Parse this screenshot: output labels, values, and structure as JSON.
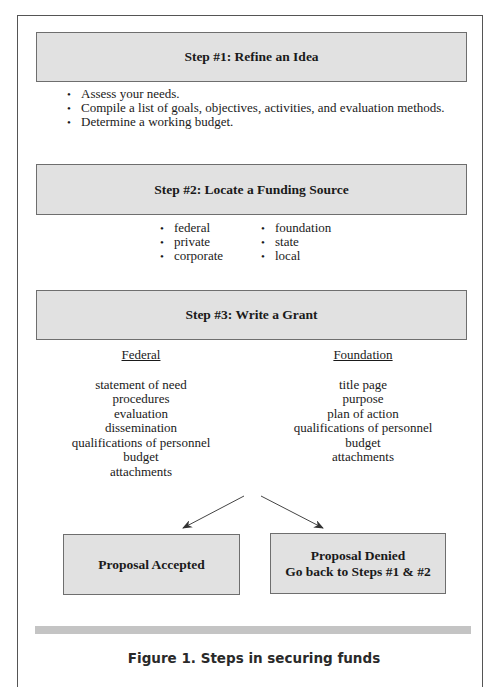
{
  "steps": [
    {
      "title": "Step #1: Refine an Idea",
      "bullets": [
        "Assess your needs.",
        "Compile a list of goals, objectives, activities, and evaluation methods.",
        "Determine a working budget."
      ]
    },
    {
      "title": "Step #2: Locate a Funding Source",
      "bullets_col1": [
        "federal",
        "private",
        "corporate"
      ],
      "bullets_col2": [
        "foundation",
        "state",
        "local"
      ]
    },
    {
      "title": "Step #3: Write a Grant",
      "columns": [
        {
          "heading": "Federal",
          "items": [
            "statement of need",
            "procedures",
            "evaluation",
            "dissemination",
            "qualifications of personnel",
            "budget",
            "attachments"
          ]
        },
        {
          "heading": "Foundation",
          "items": [
            "title page",
            "purpose",
            "plan of action",
            "qualifications of personnel",
            "budget",
            "attachments"
          ]
        }
      ]
    }
  ],
  "outcomes": {
    "accepted": {
      "line1": "Proposal Accepted"
    },
    "denied": {
      "line1": "Proposal Denied",
      "line2": "Go back to Steps #1 & #2"
    }
  },
  "caption": "Figure 1. Steps in securing funds",
  "colors": {
    "box_fill": "#e1e1e1",
    "box_border": "#6e6e6e",
    "bar": "#c4c4c4",
    "frame": "#555555"
  }
}
